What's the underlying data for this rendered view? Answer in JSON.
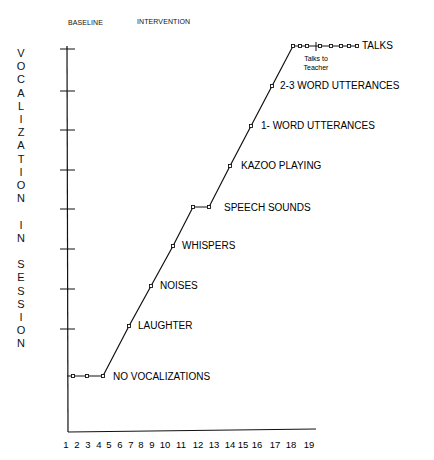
{
  "chart_data": {
    "type": "line",
    "title": "",
    "phases": [
      "BASELINE",
      "INTERVENTION"
    ],
    "xlabel": "",
    "ylabel": "VOCALIZATION IN SESSION",
    "x": [
      1,
      2,
      3,
      4,
      5,
      6,
      7,
      8,
      9,
      10,
      11,
      12,
      13,
      14,
      15,
      16,
      17,
      18,
      19
    ],
    "xticks": [
      "1",
      "2",
      "3",
      "4",
      "5",
      "6",
      "7",
      "8",
      "9",
      "10",
      "11",
      "12",
      "13",
      "14",
      "15",
      "16",
      "17",
      "18",
      "19"
    ],
    "levels": [
      "NO VOCALIZATIONS",
      "LAUGHTER",
      "NOISES",
      "WHISPERS",
      "SPEECH SOUNDS",
      "KAZOO PLAYING",
      "1- WORD UTTERANCES",
      "2-3 WORD UTTERANCES",
      "TALKS"
    ],
    "series": [
      {
        "name": "Vocalization level",
        "points": [
          {
            "x": 2,
            "y": 0
          },
          {
            "x": 3,
            "y": 0
          },
          {
            "x": 4,
            "y": 0
          },
          {
            "x": 6,
            "y": 1
          },
          {
            "x": 7,
            "y": 2
          },
          {
            "x": 9,
            "y": 3
          },
          {
            "x": 10,
            "y": 4
          },
          {
            "x": 11,
            "y": 4
          },
          {
            "x": 13,
            "y": 5
          },
          {
            "x": 14,
            "y": 6
          },
          {
            "x": 15,
            "y": 7
          },
          {
            "x": 17,
            "y": 8
          },
          {
            "x": 18,
            "y": 8
          },
          {
            "x": 19,
            "y": 8
          }
        ]
      }
    ],
    "annotations": [
      "Talks to Teacher"
    ],
    "grid": false
  },
  "labels": {
    "baseline": "BASELINE",
    "intervention": "INTERVENTION",
    "ylabel_letters": [
      "V",
      "O",
      "C",
      "A",
      "L",
      "I",
      "Z",
      "A",
      "T",
      "I",
      "O",
      "N",
      "",
      "I",
      "N",
      "",
      "S",
      "E",
      "S",
      "S",
      "I",
      "O",
      "N"
    ],
    "talks_teacher_1": "Talks to",
    "talks_teacher_2": "Teacher"
  }
}
